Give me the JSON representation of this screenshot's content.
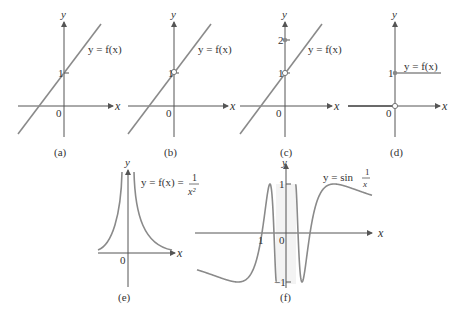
{
  "panels": [
    {
      "id": "a",
      "caption": "(a)",
      "curve_label": "y = f(x)",
      "y_label": "y",
      "x_label": "x",
      "origin": "0",
      "ticks": [
        "1"
      ],
      "description": "line through (0,1), filled"
    },
    {
      "id": "b",
      "caption": "(b)",
      "curve_label": "y = f(x)",
      "y_label": "y",
      "x_label": "x",
      "origin": "0",
      "ticks": [
        "1"
      ],
      "description": "line with open hole at (0,1)"
    },
    {
      "id": "c",
      "caption": "(c)",
      "curve_label": "y = f(x)",
      "y_label": "y",
      "x_label": "x",
      "origin": "0",
      "ticks": [
        "1",
        "2"
      ],
      "description": "line with hole at (0,1), filled point at (0,2)"
    },
    {
      "id": "d",
      "caption": "(d)",
      "curve_label": "y = f(x)",
      "y_label": "y",
      "x_label": "x",
      "origin": "0",
      "ticks": [
        "1"
      ],
      "description": "step function: 0 for x<0 (open at 0), 1 for x>=0 (filled)"
    },
    {
      "id": "e",
      "caption": "(e)",
      "curve_label": "y = f(x) =",
      "curve_label_frac_num": "1",
      "curve_label_frac_den": "x²",
      "y_label": "y",
      "x_label": "x",
      "origin": "0",
      "description": "y = 1/x^2"
    },
    {
      "id": "f",
      "caption": "(f)",
      "curve_label": "y = sin",
      "curve_label_frac_num": "1",
      "curve_label_frac_den": "x",
      "y_label": "y",
      "x_label": "x",
      "origin": "0",
      "ticks": [
        "1",
        "−1"
      ],
      "x_tick": "1",
      "description": "y = sin(1/x)"
    }
  ]
}
